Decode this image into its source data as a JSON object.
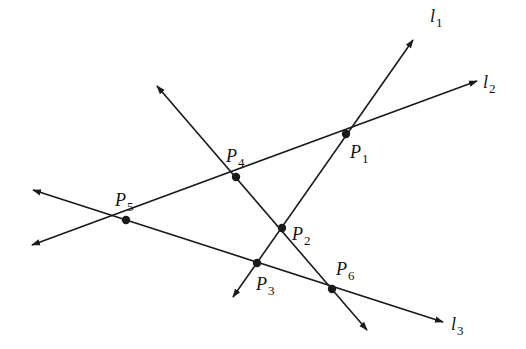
{
  "diagram": {
    "type": "geometry-lines-intersections",
    "stroke_color": "#1a1a1a",
    "background": "#ffffff",
    "lines": [
      {
        "id": "l1",
        "label": "l",
        "sub": "1",
        "from": [
          233,
          297
        ],
        "to": [
          413,
          40
        ],
        "arrow_start": true,
        "arrow_end": true,
        "label_pos": [
          430,
          22
        ]
      },
      {
        "id": "l2",
        "label": "l",
        "sub": "2",
        "from": [
          32,
          245
        ],
        "to": [
          477,
          81
        ],
        "arrow_start": true,
        "arrow_end": true,
        "label_pos": [
          483,
          88
        ]
      },
      {
        "id": "l3",
        "label": "l",
        "sub": "3",
        "from": [
          33,
          190
        ],
        "to": [
          443,
          322
        ],
        "arrow_start": true,
        "arrow_end": true,
        "label_pos": [
          451,
          330
        ]
      },
      {
        "id": "l4",
        "label": "",
        "sub": "",
        "from": [
          157,
          86
        ],
        "to": [
          367,
          330
        ],
        "arrow_start": true,
        "arrow_end": true,
        "label_pos": null
      }
    ],
    "points": [
      {
        "id": "P1",
        "label": "P",
        "sub": "1",
        "x": 346,
        "y": 134,
        "label_pos": [
          350,
          158
        ]
      },
      {
        "id": "P2",
        "label": "P",
        "sub": "2",
        "x": 282,
        "y": 228,
        "label_pos": [
          292,
          240
        ]
      },
      {
        "id": "P3",
        "label": "P",
        "sub": "3",
        "x": 257,
        "y": 263,
        "label_pos": [
          256,
          290
        ]
      },
      {
        "id": "P4",
        "label": "P",
        "sub": "4",
        "x": 236,
        "y": 177,
        "label_pos": [
          226,
          162
        ]
      },
      {
        "id": "P5",
        "label": "P",
        "sub": "5",
        "x": 126,
        "y": 220,
        "label_pos": [
          115,
          206
        ]
      },
      {
        "id": "P6",
        "label": "P",
        "sub": "6",
        "x": 332,
        "y": 289,
        "label_pos": [
          336,
          275
        ]
      }
    ]
  }
}
